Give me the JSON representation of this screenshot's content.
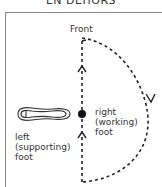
{
  "title": "EN DEHORS",
  "labels": {
    "front": "Front",
    "right_line1": "right",
    "right_line2": "(working)",
    "right_line3": "foot",
    "left_line1": "left",
    "left_line2": "(supporting)",
    "left_line3": "foot"
  },
  "colors": {
    "ink": "#222222",
    "frame": "#888888"
  }
}
